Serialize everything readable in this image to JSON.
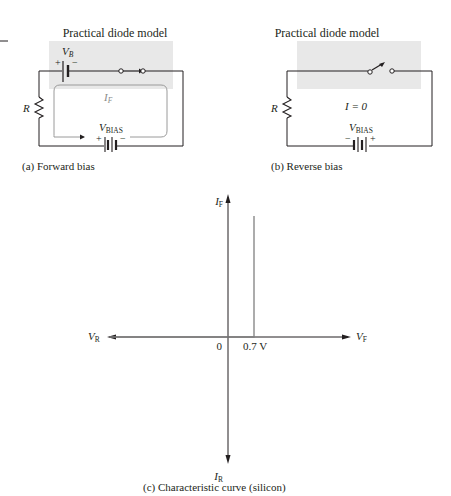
{
  "figure": {
    "panel_a": {
      "title": "Practical diode model",
      "caption": "(a)  Forward bias",
      "battery_label": "V",
      "battery_label_sub": "B",
      "battery_plus": "+",
      "battery_minus": "−",
      "resistor_label": "R",
      "current_label": "I",
      "current_label_sub": "F",
      "source_label": "V",
      "source_label_sub": "BIAS",
      "source_plus": "+",
      "source_minus": "−",
      "switch_state": "closed"
    },
    "panel_b": {
      "title": "Practical diode model",
      "caption": "(b)  Reverse bias",
      "resistor_label": "R",
      "current_label": "I = 0",
      "source_label": "V",
      "source_label_sub": "BIAS",
      "source_plus": "+",
      "source_minus": "−",
      "switch_state": "open"
    },
    "panel_c": {
      "caption": "(c)  Characteristic curve (silicon)",
      "axis_top": "I",
      "axis_top_sub": "F",
      "axis_bottom": "I",
      "axis_bottom_sub": "R",
      "axis_left": "V",
      "axis_left_sub": "R",
      "axis_right": "V",
      "axis_right_sub": "F",
      "origin_label": "0",
      "knee_label": "0.7 V"
    },
    "colors": {
      "shade": "#e8e8e8",
      "line": "#231f20",
      "curve": "#808080"
    }
  }
}
